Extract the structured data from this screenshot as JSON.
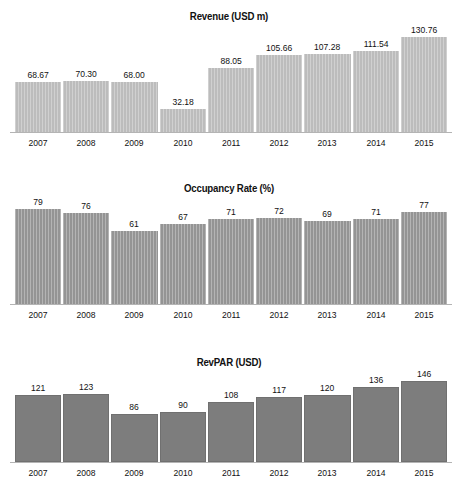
{
  "chart_data": [
    {
      "type": "bar",
      "title": "Revenue (USD m)",
      "xlabel": "",
      "ylabel": "Revenue (USD m)",
      "categories": [
        "2007",
        "2008",
        "2009",
        "2010",
        "2011",
        "2012",
        "2013",
        "2014",
        "2015"
      ],
      "values": [
        68.67,
        70.3,
        68.0,
        32.18,
        88.05,
        105.66,
        107.28,
        111.54,
        130.76
      ],
      "value_labels": [
        "68.67",
        "70.30",
        "68.00",
        "32.18",
        "88.05",
        "105.66",
        "107.28",
        "111.54",
        "130.76"
      ],
      "ylim": [
        0,
        140
      ],
      "grid": false,
      "legend": "none",
      "bar_color": "#bcbcbc",
      "bar_texture": "vertical-pinstripe"
    },
    {
      "type": "bar",
      "title": "Occupancy Rate (%)",
      "xlabel": "",
      "ylabel": "Occupancy Rate (%)",
      "categories": [
        "2007",
        "2008",
        "2009",
        "2010",
        "2011",
        "2012",
        "2013",
        "2014",
        "2015"
      ],
      "values": [
        79,
        76,
        61,
        67,
        71,
        72,
        69,
        71,
        77
      ],
      "value_labels": [
        "79",
        "76",
        "61",
        "67",
        "71",
        "72",
        "69",
        "71",
        "77"
      ],
      "ylim": [
        0,
        85
      ],
      "grid": false,
      "legend": "none",
      "bar_color": "#949494",
      "bar_texture": "vertical-pinstripe"
    },
    {
      "type": "bar",
      "title": "RevPAR (USD)",
      "xlabel": "",
      "ylabel": "RevPAR (USD)",
      "categories": [
        "2007",
        "2008",
        "2009",
        "2010",
        "2011",
        "2012",
        "2013",
        "2014",
        "2015"
      ],
      "values": [
        121,
        123,
        86,
        90,
        108,
        117,
        120,
        136,
        146
      ],
      "value_labels": [
        "121",
        "123",
        "86",
        "90",
        "108",
        "117",
        "120",
        "136",
        "146"
      ],
      "ylim": [
        0,
        155
      ],
      "grid": false,
      "legend": "none",
      "bar_color": "#7d7d7d",
      "bar_texture": "solid"
    }
  ],
  "colors": {
    "background": "#ffffff",
    "text": "#111111",
    "axis": "#b4b4b4"
  },
  "footnote": ""
}
